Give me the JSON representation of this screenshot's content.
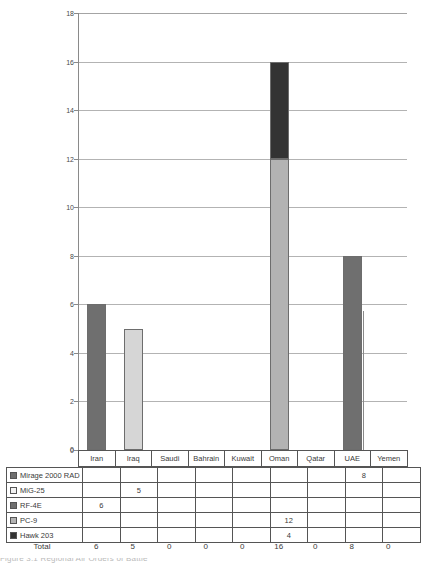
{
  "chart_data": {
    "type": "bar",
    "stacked": true,
    "title": "",
    "xlabel": "",
    "ylabel": "",
    "ylim": [
      0,
      18
    ],
    "ytick_step": 2,
    "yticks": [
      0,
      2,
      4,
      6,
      8,
      10,
      12,
      14,
      16,
      18
    ],
    "grid": true,
    "legend_position": "table-left",
    "categories": [
      "Iran",
      "Iraq",
      "Saudi",
      "Bahrain",
      "Kuwait",
      "Oman",
      "Qatar",
      "UAE",
      "Yemen"
    ],
    "series": [
      {
        "name": "Mirage 2000 RAD",
        "color": "#6f6f6f",
        "values": [
          0,
          0,
          0,
          0,
          0,
          0,
          0,
          8,
          0
        ]
      },
      {
        "name": "MiG-25",
        "color": "#d6d6d6",
        "values": [
          0,
          5,
          0,
          0,
          0,
          0,
          0,
          0,
          0
        ]
      },
      {
        "name": "RF-4E",
        "color": "#6f6f6f",
        "values": [
          6,
          0,
          0,
          0,
          0,
          0,
          0,
          0,
          0
        ]
      },
      {
        "name": "PC-9",
        "color": "#b3b3b3",
        "values": [
          0,
          0,
          0,
          0,
          0,
          12,
          0,
          0,
          0
        ]
      },
      {
        "name": "Hawk 203",
        "color": "#333333",
        "values": [
          0,
          0,
          0,
          0,
          0,
          4,
          0,
          0,
          0
        ]
      }
    ],
    "totals": [
      6,
      5,
      0,
      0,
      0,
      16,
      0,
      8,
      0
    ],
    "totals_label": "Total"
  },
  "axis": {
    "y_tick_labels": [
      "18",
      "16",
      "14",
      "12",
      "10",
      "8",
      "6",
      "4",
      "2",
      "0"
    ],
    "zero_label": "0"
  },
  "table": {
    "rows": [
      {
        "label": "Mirage 2000 RAD",
        "swatch": "#6f6f6f",
        "cells": [
          "",
          "",
          "",
          "",
          "",
          "",
          "",
          "8",
          ""
        ]
      },
      {
        "label": "MiG-25",
        "swatch": "#f2f2f2",
        "cells": [
          "",
          "5",
          "",
          "",
          "",
          "",
          "",
          "",
          ""
        ]
      },
      {
        "label": "RF-4E",
        "swatch": "#6f6f6f",
        "cells": [
          "6",
          "",
          "",
          "",
          "",
          "",
          "",
          "",
          ""
        ]
      },
      {
        "label": "PC-9",
        "swatch": "#b3b3b3",
        "cells": [
          "",
          "",
          "",
          "",
          "",
          "12",
          "",
          "",
          ""
        ]
      },
      {
        "label": "Hawk 203",
        "swatch": "#333333",
        "cells": [
          "",
          "",
          "",
          "",
          "",
          "4",
          "",
          "",
          ""
        ]
      }
    ]
  },
  "caption": {
    "sliver_text": "Figure 3.1 Regional Air Orders of Battle"
  }
}
